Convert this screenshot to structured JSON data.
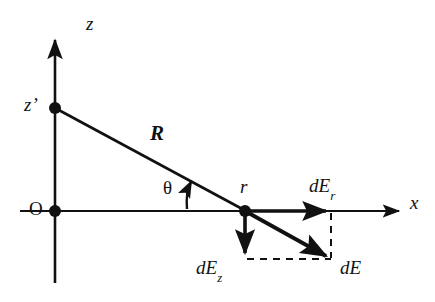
{
  "figure": {
    "type": "physics-vector-diagram",
    "background_color": "#ffffff",
    "stroke_color": "#111111"
  },
  "axes": {
    "vertical": {
      "label": "z",
      "name": "z-axis",
      "arrow": "up"
    },
    "horizontal": {
      "label": "x",
      "name": "x-axis",
      "arrow": "right"
    },
    "origin_label": "O"
  },
  "points": [
    {
      "id": "origin",
      "label": "O",
      "x": 55,
      "y": 211,
      "marker": "filled-dot"
    },
    {
      "id": "source",
      "label": "z'",
      "label_plain": "z",
      "prime": "’",
      "x": 55,
      "y": 108,
      "marker": "filled-dot"
    },
    {
      "id": "field",
      "label": "r",
      "x": 245,
      "y": 211,
      "marker": "filled-dot"
    }
  ],
  "segments": [
    {
      "id": "R-line",
      "label": "R",
      "from": "source",
      "to": "field",
      "style": "solid"
    }
  ],
  "angle": {
    "label": "θ",
    "name": "theta",
    "vertex": "field",
    "between": [
      "x-axis",
      "R-line"
    ],
    "marker": "curved-arrow"
  },
  "vectors": [
    {
      "id": "dEr",
      "label_main": "dE",
      "label_sub": "r",
      "direction": "+x",
      "from": {
        "x": 245,
        "y": 211
      },
      "to": {
        "x": 331,
        "y": 211
      },
      "style": "solid-thick"
    },
    {
      "id": "dEz",
      "label_main": "dE",
      "label_sub": "z",
      "direction": "-z",
      "from": {
        "x": 245,
        "y": 211
      },
      "to": {
        "x": 245,
        "y": 259
      },
      "style": "solid-thick"
    },
    {
      "id": "dE",
      "label_main": "dE",
      "label_sub": "",
      "direction": "resultant",
      "from": {
        "x": 245,
        "y": 211
      },
      "to": {
        "x": 331,
        "y": 259
      },
      "style": "solid-thick"
    }
  ],
  "construction_lines": [
    {
      "id": "dashed-vertical",
      "from": {
        "x": 331,
        "y": 211
      },
      "to": {
        "x": 331,
        "y": 259
      },
      "style": "dashed"
    },
    {
      "id": "dashed-horizontal",
      "from": {
        "x": 245,
        "y": 259
      },
      "to": {
        "x": 331,
        "y": 259
      },
      "style": "dashed"
    }
  ],
  "labels": {
    "z": "z",
    "z_prime": "z’",
    "O": "O",
    "R": "R",
    "theta": "θ",
    "r": "r",
    "dE_r_main": "dE",
    "dE_r_sub": "r",
    "dE_z_main": "dE",
    "dE_z_sub": "z",
    "dE": "dE",
    "x": "x"
  }
}
